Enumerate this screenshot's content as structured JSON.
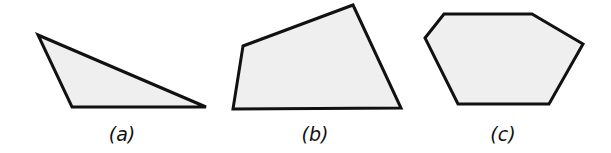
{
  "figure": {
    "fill_color": "#efefef",
    "stroke_color": "#111111",
    "shapes": [
      {
        "id": "a",
        "kind": "triangle",
        "label": "(a)"
      },
      {
        "id": "b",
        "kind": "quadrilateral",
        "label": "(b)"
      },
      {
        "id": "c",
        "kind": "hexagon",
        "label": "(c)"
      }
    ]
  }
}
